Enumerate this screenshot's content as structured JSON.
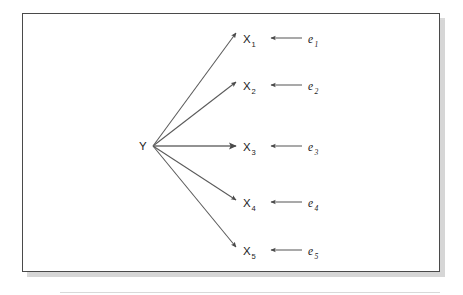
{
  "figure": {
    "kind": "path-diagram",
    "background_color": "#ffffff",
    "panel": {
      "border_color": "#4a4a4a",
      "fill_color": "#ffffff",
      "shadow_color": "#b9b9b9",
      "x": 22,
      "y": 13,
      "width": 418,
      "height": 259
    },
    "baseline_rule": {
      "color": "#d5d5d5",
      "y": 292
    },
    "stroke_color": "#5a5a5a",
    "text_color": "#1b1b1b"
  },
  "latent": {
    "id": "Y",
    "label": "Y",
    "x": 143,
    "y": 149,
    "fan_origin_x": 153,
    "fan_origin_y": 146
  },
  "indicators": [
    {
      "id": "X1",
      "label": "X",
      "subscript": "1",
      "x": 249,
      "y": 43,
      "arrow_tip_x": 236,
      "arrow_tip_y": 33
    },
    {
      "id": "X2",
      "label": "X",
      "subscript": "2",
      "x": 249,
      "y": 90,
      "arrow_tip_x": 236,
      "arrow_tip_y": 82
    },
    {
      "id": "X3",
      "label": "X",
      "subscript": "3",
      "x": 249,
      "y": 151,
      "arrow_tip_x": 236,
      "arrow_tip_y": 146
    },
    {
      "id": "X4",
      "label": "X",
      "subscript": "4",
      "x": 249,
      "y": 207,
      "arrow_tip_x": 236,
      "arrow_tip_y": 200
    },
    {
      "id": "X5",
      "label": "X",
      "subscript": "5",
      "x": 249,
      "y": 255,
      "arrow_tip_x": 236,
      "arrow_tip_y": 247
    }
  ],
  "errors": [
    {
      "id": "e1",
      "label": "e",
      "subscript": "1",
      "x": 310,
      "y": 43,
      "arrow_from_x": 302,
      "arrow_to_x": 271,
      "arrow_y": 38
    },
    {
      "id": "e2",
      "label": "e",
      "subscript": "2",
      "x": 310,
      "y": 90,
      "arrow_from_x": 302,
      "arrow_to_x": 271,
      "arrow_y": 85
    },
    {
      "id": "e3",
      "label": "e",
      "subscript": "3",
      "x": 310,
      "y": 151,
      "arrow_from_x": 302,
      "arrow_to_x": 271,
      "arrow_y": 146
    },
    {
      "id": "e4",
      "label": "e",
      "subscript": "4",
      "x": 310,
      "y": 207,
      "arrow_from_x": 302,
      "arrow_to_x": 271,
      "arrow_y": 202
    },
    {
      "id": "e5",
      "label": "e",
      "subscript": "5",
      "x": 310,
      "y": 255,
      "arrow_from_x": 302,
      "arrow_to_x": 271,
      "arrow_y": 250
    }
  ]
}
